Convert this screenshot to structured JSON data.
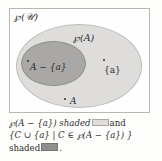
{
  "figure": {
    "universe_label": "℘(𝒰)",
    "outer_set_label": "℘(A)",
    "inner_set_label": "A − {a}",
    "singleton_label": "{a}",
    "base_set_label": "A"
  },
  "caption": {
    "line1_text": "℘(A − {a}) shaded",
    "line1_tail": "and",
    "line2_text": "{C ∪ {a} | C ∈ ℘(A − {a}) }",
    "line3_text": "shaded",
    "line3_tail": "."
  },
  "colors": {
    "outer_fill": "#dedddb",
    "inner_fill": "#a9a8a6",
    "swatch_light": "#dedddb",
    "swatch_dark": "#8f8f8d",
    "box_border": "#b9b9b4",
    "text": "#2b2b2b",
    "page_background": "#fdfdfc"
  }
}
